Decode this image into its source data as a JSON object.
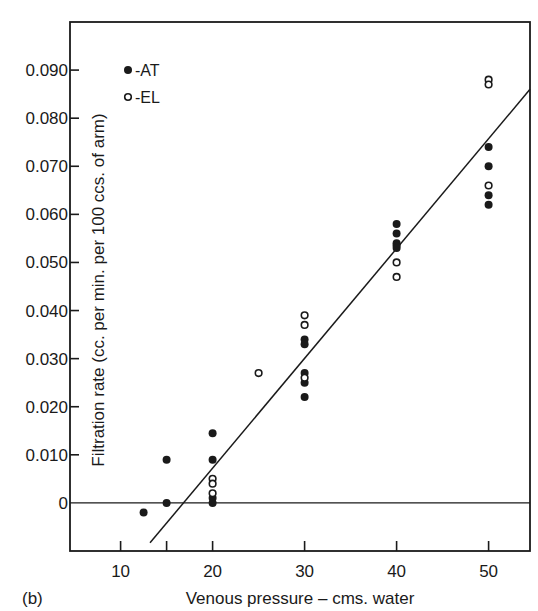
{
  "chart_data": {
    "type": "scatter",
    "panel_label": "(b)",
    "title": "",
    "xlabel": "Venous pressure – cms. water",
    "ylabel": "Filtration rate (cc. per min. per 100 ccs. of arm)",
    "xlim": [
      4.5,
      54.5
    ],
    "ylim": [
      -0.01,
      0.1
    ],
    "grid": false,
    "legend_position": "upper-left",
    "x_ticks": [
      10,
      15,
      20,
      30,
      40,
      50
    ],
    "x_tick_labels": [
      {
        "value": 10,
        "label": "10"
      },
      {
        "value": 20,
        "label": "20"
      },
      {
        "value": 30,
        "label": "30"
      },
      {
        "value": 40,
        "label": "40"
      },
      {
        "value": 50,
        "label": "50"
      }
    ],
    "y_ticks": [
      {
        "value": 0,
        "label": "0"
      },
      {
        "value": 0.01,
        "label": "0.010"
      },
      {
        "value": 0.02,
        "label": "0.020"
      },
      {
        "value": 0.03,
        "label": "0.030"
      },
      {
        "value": 0.04,
        "label": "0.040"
      },
      {
        "value": 0.05,
        "label": "0.050"
      },
      {
        "value": 0.06,
        "label": "0.060"
      },
      {
        "value": 0.07,
        "label": "0.070"
      },
      {
        "value": 0.08,
        "label": "0.080"
      },
      {
        "value": 0.09,
        "label": "0.090"
      }
    ],
    "zero_line": true,
    "series": [
      {
        "name": "AT",
        "legend_label": "-AT",
        "marker": "filled-circle",
        "points": [
          {
            "x": 12.5,
            "y": -0.002
          },
          {
            "x": 15,
            "y": 0.009
          },
          {
            "x": 15,
            "y": 0.0
          },
          {
            "x": 20,
            "y": 0.0145
          },
          {
            "x": 20,
            "y": 0.009
          },
          {
            "x": 20,
            "y": 0.001
          },
          {
            "x": 20,
            "y": 0.0
          },
          {
            "x": 30,
            "y": 0.034
          },
          {
            "x": 30,
            "y": 0.033
          },
          {
            "x": 30,
            "y": 0.027
          },
          {
            "x": 30,
            "y": 0.025
          },
          {
            "x": 30,
            "y": 0.022
          },
          {
            "x": 40,
            "y": 0.058
          },
          {
            "x": 40,
            "y": 0.056
          },
          {
            "x": 40,
            "y": 0.054
          },
          {
            "x": 40,
            "y": 0.0535
          },
          {
            "x": 40,
            "y": 0.053
          },
          {
            "x": 50,
            "y": 0.074
          },
          {
            "x": 50,
            "y": 0.07
          },
          {
            "x": 50,
            "y": 0.064
          },
          {
            "x": 50,
            "y": 0.062
          }
        ]
      },
      {
        "name": "EL",
        "legend_label": "-EL",
        "marker": "open-circle",
        "points": [
          {
            "x": 20,
            "y": 0.005
          },
          {
            "x": 20,
            "y": 0.004
          },
          {
            "x": 20,
            "y": 0.002
          },
          {
            "x": 25,
            "y": 0.027
          },
          {
            "x": 30,
            "y": 0.039
          },
          {
            "x": 30,
            "y": 0.037
          },
          {
            "x": 30,
            "y": 0.026
          },
          {
            "x": 40,
            "y": 0.05
          },
          {
            "x": 40,
            "y": 0.047
          },
          {
            "x": 50,
            "y": 0.088
          },
          {
            "x": 50,
            "y": 0.087
          },
          {
            "x": 50,
            "y": 0.066
          }
        ]
      }
    ],
    "fit_line": {
      "type": "linear",
      "x": [
        13.2,
        54.5
      ],
      "y": [
        -0.0083,
        0.086
      ]
    }
  }
}
